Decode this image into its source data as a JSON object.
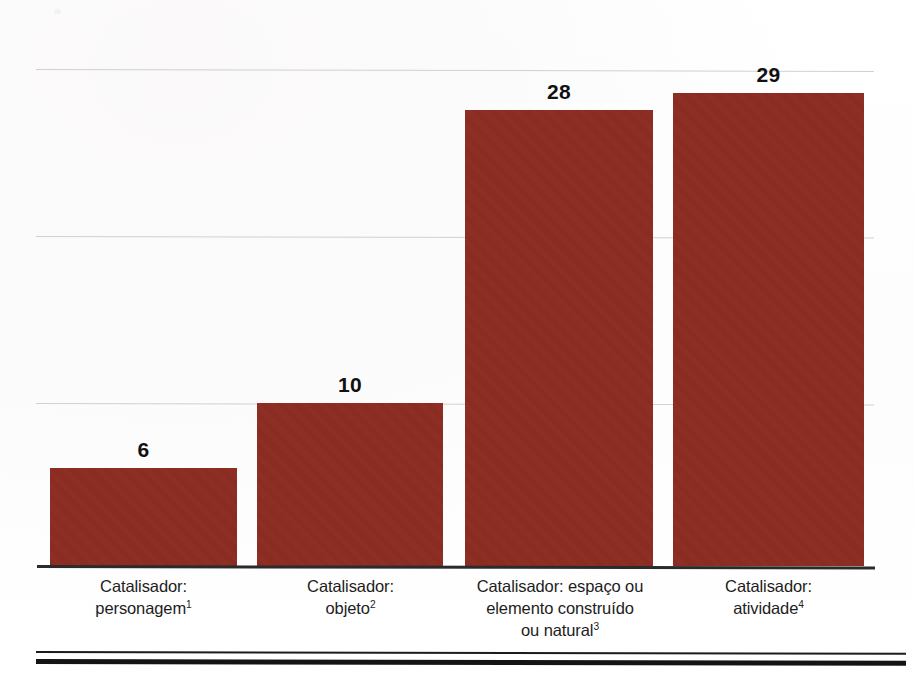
{
  "chart_data": {
    "type": "bar",
    "title": "",
    "subtitle": "",
    "xlabel": "",
    "ylabel": "",
    "ylim": [
      0,
      34
    ],
    "grid": true,
    "gridlines": [
      10,
      20,
      30
    ],
    "legend": "none",
    "orientation": "vertical",
    "bar_color": "#8d2b22",
    "categories": [
      "Catalisador: personagem",
      "Catalisador: objeto",
      "Catalisador: espaço ou elemento construído ou natural",
      "Catalisador: atividade"
    ],
    "category_lines": [
      [
        "Catalisador:",
        "personagem"
      ],
      [
        "Catalisador:",
        "objeto"
      ],
      [
        "Catalisador: espaço ou",
        "elemento construído",
        "ou natural"
      ],
      [
        "Catalisador:",
        "atividade"
      ]
    ],
    "footnote_markers": [
      "1",
      "2",
      "3",
      "4"
    ],
    "values": [
      6,
      10,
      28,
      29
    ],
    "value_labels": [
      "6",
      "10",
      "28",
      "29"
    ]
  },
  "bars": [
    {
      "label": "6",
      "value": 6,
      "cat_line1": "Catalisador:",
      "cat_line2": "personagem",
      "cat_line3": "",
      "sup": "1"
    },
    {
      "label": "10",
      "value": 10,
      "cat_line1": "Catalisador:",
      "cat_line2": "objeto",
      "cat_line3": "",
      "sup": "2"
    },
    {
      "label": "28",
      "value": 28,
      "cat_line1": "Catalisador: espaço ou",
      "cat_line2": "elemento construído",
      "cat_line3": "ou natural",
      "sup": "3"
    },
    {
      "label": "29",
      "value": 29,
      "cat_line1": "Catalisador:",
      "cat_line2": "atividade",
      "cat_line3": "",
      "sup": "4"
    }
  ],
  "colors": {
    "bar": "#8d2b22",
    "gridline": "#c9c9c9",
    "axis": "#2b2b2b",
    "text": "#1d1d1d",
    "value_text": "#111111",
    "background": "#ffffff"
  }
}
